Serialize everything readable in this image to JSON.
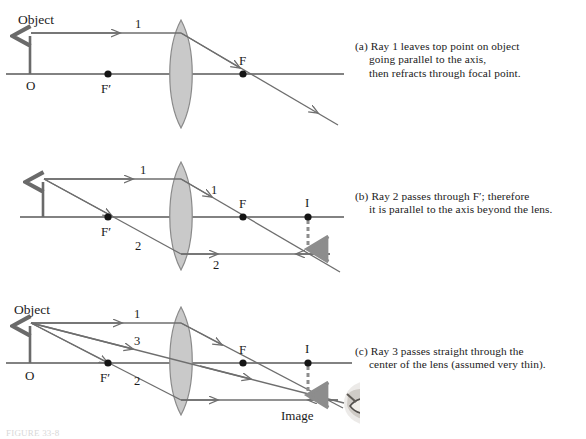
{
  "figure": {
    "bottom_caption": "FIGURE 33-8",
    "colors": {
      "axis": "#585858",
      "ray": "#6e6e6e",
      "object_arrow": "#6a6a6a",
      "lens_fill": "#c9c9c9",
      "lens_stroke": "#8a8a8a",
      "point_marker": "#151515",
      "dashed_image": "#8d8d8d",
      "text": "#1b1b1b"
    }
  },
  "panels": [
    {
      "id": "a",
      "label": "(a)",
      "caption_lines": [
        "(a) Ray 1 leaves top point on object",
        "going parallel to the axis,",
        "then refracts through focal point."
      ],
      "labels": {
        "object": "Object",
        "origin": "O",
        "focal_near": "F′",
        "focal_far": "F",
        "ray_parallel": "1"
      }
    },
    {
      "id": "b",
      "label": "(b)",
      "caption_lines": [
        "(b) Ray 2 passes through F′; therefore",
        "it is parallel to the axis beyond the lens."
      ],
      "labels": {
        "origin": "O",
        "focal_near": "F′",
        "focal_far": "F",
        "image_point": "I",
        "ray_1_in": "1",
        "ray_1_out": "1",
        "ray_2_in": "2",
        "ray_2_out": "2"
      }
    },
    {
      "id": "c",
      "label": "(c)",
      "caption_lines": [
        "(c) Ray 3 passes straight through the",
        "center of the lens (assumed very thin)."
      ],
      "labels": {
        "object": "Object",
        "origin": "O",
        "focal_near": "F′",
        "focal_far": "F",
        "image_point": "I",
        "image": "Image",
        "ray_1": "1",
        "ray_3": "3",
        "ray_2": "2"
      }
    }
  ],
  "icons": {
    "eye": "eye-observer-icon"
  }
}
